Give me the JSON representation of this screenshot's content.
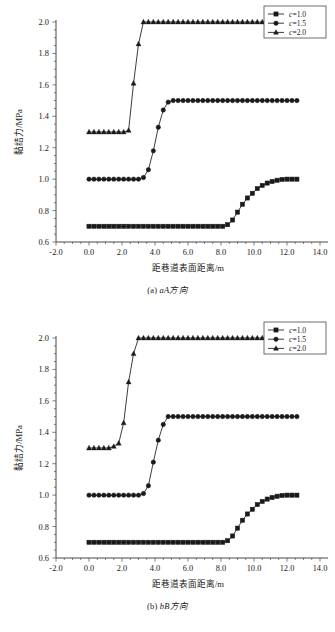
{
  "figure": {
    "panels": [
      {
        "id": "panel-a",
        "caption_index": "(a)",
        "caption_direction": "aA方向"
      },
      {
        "id": "panel-b",
        "caption_index": "(b)",
        "caption_direction": "bB方向"
      }
    ]
  },
  "chart_data": [
    {
      "type": "line",
      "title": "(a) aA方向",
      "xlabel": "距巷道表面距离/m",
      "ylabel": "黏结力/MPa",
      "xlim": [
        -2.0,
        14.0
      ],
      "ylim": [
        0.6,
        2.0
      ],
      "xticks": [
        -2.0,
        0.0,
        2.0,
        4.0,
        6.0,
        8.0,
        10.0,
        12.0,
        14.0
      ],
      "xtick_labels": [
        "-2.0",
        "0.0",
        "2.0",
        "4.0",
        "6.0",
        "8.0",
        "10.0",
        "12.0",
        "14.0"
      ],
      "yticks": [
        0.6,
        0.8,
        1.0,
        1.2,
        1.4,
        1.6,
        1.8,
        2.0
      ],
      "ytick_labels": [
        "0.6",
        "0.8",
        "1.0",
        "1.2",
        "1.4",
        "1.6",
        "1.8",
        "2.0"
      ],
      "x_minor_interval": 0.5,
      "y_minor_interval": 0.05,
      "grid": false,
      "legend_position": "top-right",
      "series": [
        {
          "name": "c=1.0",
          "marker": "square",
          "x": [
            0.0,
            0.3,
            0.6,
            0.9,
            1.2,
            1.5,
            1.8,
            2.1,
            2.4,
            2.7,
            3.0,
            3.3,
            3.6,
            3.9,
            4.2,
            4.5,
            4.8,
            5.1,
            5.4,
            5.7,
            6.0,
            6.3,
            6.6,
            6.9,
            7.2,
            7.5,
            7.8,
            8.1,
            8.4,
            8.7,
            9.0,
            9.3,
            9.6,
            9.9,
            10.2,
            10.5,
            10.8,
            11.1,
            11.4,
            11.7,
            12.0,
            12.3,
            12.6
          ],
          "y": [
            0.7,
            0.7,
            0.7,
            0.7,
            0.7,
            0.7,
            0.7,
            0.7,
            0.7,
            0.7,
            0.7,
            0.7,
            0.7,
            0.7,
            0.7,
            0.7,
            0.7,
            0.7,
            0.7,
            0.7,
            0.7,
            0.7,
            0.7,
            0.7,
            0.7,
            0.7,
            0.7,
            0.7,
            0.71,
            0.74,
            0.79,
            0.84,
            0.88,
            0.91,
            0.94,
            0.96,
            0.975,
            0.985,
            0.993,
            0.998,
            1.0,
            1.0,
            1.0
          ]
        },
        {
          "name": "c=1.5",
          "marker": "circle",
          "x": [
            0.0,
            0.3,
            0.6,
            0.9,
            1.2,
            1.5,
            1.8,
            2.1,
            2.4,
            2.7,
            3.0,
            3.3,
            3.6,
            3.9,
            4.2,
            4.5,
            4.8,
            5.1,
            5.4,
            5.7,
            6.0,
            6.3,
            6.6,
            6.9,
            7.2,
            7.5,
            7.8,
            8.1,
            8.4,
            8.7,
            9.0,
            9.3,
            9.6,
            9.9,
            10.2,
            10.5,
            10.8,
            11.1,
            11.4,
            11.7,
            12.0,
            12.3,
            12.6
          ],
          "y": [
            1.0,
            1.0,
            1.0,
            1.0,
            1.0,
            1.0,
            1.0,
            1.0,
            1.0,
            1.0,
            1.0,
            1.01,
            1.06,
            1.18,
            1.33,
            1.44,
            1.49,
            1.5,
            1.5,
            1.5,
            1.5,
            1.5,
            1.5,
            1.5,
            1.5,
            1.5,
            1.5,
            1.5,
            1.5,
            1.5,
            1.5,
            1.5,
            1.5,
            1.5,
            1.5,
            1.5,
            1.5,
            1.5,
            1.5,
            1.5,
            1.5,
            1.5,
            1.5
          ]
        },
        {
          "name": "c=2.0",
          "marker": "triangle",
          "x": [
            0.0,
            0.3,
            0.6,
            0.9,
            1.2,
            1.5,
            1.8,
            2.1,
            2.4,
            2.7,
            3.0,
            3.3,
            3.6,
            3.9,
            4.2,
            4.5,
            4.8,
            5.1,
            5.4,
            5.7,
            6.0,
            6.3,
            6.6,
            6.9,
            7.2,
            7.5,
            7.8,
            8.1,
            8.4,
            8.7,
            9.0,
            9.3,
            9.6,
            9.9,
            10.2,
            10.5,
            10.8,
            11.1,
            11.4,
            11.7,
            12.0,
            12.3,
            12.6
          ],
          "y": [
            1.3,
            1.3,
            1.3,
            1.3,
            1.3,
            1.3,
            1.3,
            1.3,
            1.31,
            1.61,
            1.86,
            2.0,
            2.0,
            2.0,
            2.0,
            2.0,
            2.0,
            2.0,
            2.0,
            2.0,
            2.0,
            2.0,
            2.0,
            2.0,
            2.0,
            2.0,
            2.0,
            2.0,
            2.0,
            2.0,
            2.0,
            2.0,
            2.0,
            2.0,
            2.0,
            2.0,
            2.0,
            2.0,
            2.0,
            2.0,
            2.0,
            2.0,
            2.0
          ]
        }
      ]
    },
    {
      "type": "line",
      "title": "(b) bB方向",
      "xlabel": "距巷道表面距离/m",
      "ylabel": "黏结力/MPa",
      "xlim": [
        -2.0,
        14.0
      ],
      "ylim": [
        0.6,
        2.0
      ],
      "xticks": [
        -2.0,
        0.0,
        2.0,
        4.0,
        6.0,
        8.0,
        10.0,
        12.0,
        14.0
      ],
      "xtick_labels": [
        "-2.0",
        "0.0",
        "2.0",
        "4.0",
        "6.0",
        "8.0",
        "10.0",
        "12.0",
        "14.0"
      ],
      "yticks": [
        0.6,
        0.8,
        1.0,
        1.2,
        1.4,
        1.6,
        1.8,
        2.0
      ],
      "ytick_labels": [
        "0.6",
        "0.8",
        "1.0",
        "1.2",
        "1.4",
        "1.6",
        "1.8",
        "2.0"
      ],
      "x_minor_interval": 0.5,
      "y_minor_interval": 0.05,
      "grid": false,
      "legend_position": "top-right",
      "series": [
        {
          "name": "c=1.0",
          "marker": "square",
          "x": [
            0.0,
            0.3,
            0.6,
            0.9,
            1.2,
            1.5,
            1.8,
            2.1,
            2.4,
            2.7,
            3.0,
            3.3,
            3.6,
            3.9,
            4.2,
            4.5,
            4.8,
            5.1,
            5.4,
            5.7,
            6.0,
            6.3,
            6.6,
            6.9,
            7.2,
            7.5,
            7.8,
            8.1,
            8.4,
            8.7,
            9.0,
            9.3,
            9.6,
            9.9,
            10.2,
            10.5,
            10.8,
            11.1,
            11.4,
            11.7,
            12.0,
            12.3,
            12.6
          ],
          "y": [
            0.7,
            0.7,
            0.7,
            0.7,
            0.7,
            0.7,
            0.7,
            0.7,
            0.7,
            0.7,
            0.7,
            0.7,
            0.7,
            0.7,
            0.7,
            0.7,
            0.7,
            0.7,
            0.7,
            0.7,
            0.7,
            0.7,
            0.7,
            0.7,
            0.7,
            0.7,
            0.7,
            0.7,
            0.71,
            0.74,
            0.79,
            0.84,
            0.88,
            0.91,
            0.94,
            0.96,
            0.975,
            0.985,
            0.993,
            0.998,
            1.0,
            1.0,
            1.0
          ]
        },
        {
          "name": "c=1.5",
          "marker": "circle",
          "x": [
            0.0,
            0.3,
            0.6,
            0.9,
            1.2,
            1.5,
            1.8,
            2.1,
            2.4,
            2.7,
            3.0,
            3.3,
            3.6,
            3.9,
            4.2,
            4.5,
            4.8,
            5.1,
            5.4,
            5.7,
            6.0,
            6.3,
            6.6,
            6.9,
            7.2,
            7.5,
            7.8,
            8.1,
            8.4,
            8.7,
            9.0,
            9.3,
            9.6,
            9.9,
            10.2,
            10.5,
            10.8,
            11.1,
            11.4,
            11.7,
            12.0,
            12.3,
            12.6
          ],
          "y": [
            1.0,
            1.0,
            1.0,
            1.0,
            1.0,
            1.0,
            1.0,
            1.0,
            1.0,
            1.0,
            1.0,
            1.01,
            1.06,
            1.21,
            1.35,
            1.45,
            1.5,
            1.5,
            1.5,
            1.5,
            1.5,
            1.5,
            1.5,
            1.5,
            1.5,
            1.5,
            1.5,
            1.5,
            1.5,
            1.5,
            1.5,
            1.5,
            1.5,
            1.5,
            1.5,
            1.5,
            1.5,
            1.5,
            1.5,
            1.5,
            1.5,
            1.5,
            1.5
          ]
        },
        {
          "name": "c=2.0",
          "marker": "triangle",
          "x": [
            0.0,
            0.3,
            0.6,
            0.9,
            1.2,
            1.5,
            1.8,
            2.1,
            2.4,
            2.7,
            3.0,
            3.3,
            3.6,
            3.9,
            4.2,
            4.5,
            4.8,
            5.1,
            5.4,
            5.7,
            6.0,
            6.3,
            6.6,
            6.9,
            7.2,
            7.5,
            7.8,
            8.1,
            8.4,
            8.7,
            9.0,
            9.3,
            9.6,
            9.9,
            10.2,
            10.5,
            10.8,
            11.1,
            11.4,
            11.7,
            12.0,
            12.3,
            12.6
          ],
          "y": [
            1.3,
            1.3,
            1.3,
            1.3,
            1.3,
            1.31,
            1.33,
            1.46,
            1.72,
            1.9,
            2.0,
            2.0,
            2.0,
            2.0,
            2.0,
            2.0,
            2.0,
            2.0,
            2.0,
            2.0,
            2.0,
            2.0,
            2.0,
            2.0,
            2.0,
            2.0,
            2.0,
            2.0,
            2.0,
            2.0,
            2.0,
            2.0,
            2.0,
            2.0,
            2.0,
            2.0,
            2.0,
            2.0,
            2.0,
            2.0,
            2.0,
            2.0,
            2.0
          ]
        }
      ]
    }
  ],
  "style": {
    "line_color": "#1a1a1a",
    "background": "#ffffff",
    "axis_color": "#4a4a4a"
  }
}
